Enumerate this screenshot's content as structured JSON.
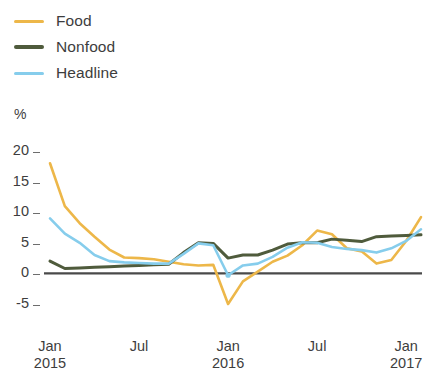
{
  "chart_data": {
    "type": "line",
    "title": "",
    "subtitle": "",
    "xlabel": "",
    "ylabel": "%",
    "ylim": [
      -7.5,
      21
    ],
    "xlim": [
      0,
      25
    ],
    "grid": false,
    "legend_position": "top-left",
    "y_ticks": [
      20,
      15,
      10,
      5,
      0,
      -5
    ],
    "y_tick_labels": [
      "20",
      "15",
      "10",
      "5",
      "0",
      "-5"
    ],
    "x_tick_positions": [
      0,
      6,
      12,
      18,
      24
    ],
    "x_tick_labels": [
      "Jan",
      "Jul",
      "Jan",
      "Jul",
      "Jan"
    ],
    "x_tick_sublabels": [
      "2015",
      "",
      "2016",
      "",
      "2017"
    ],
    "x": [
      0,
      1,
      2,
      3,
      4,
      5,
      6,
      7,
      8,
      9,
      10,
      11,
      12,
      13,
      14,
      15,
      16,
      17,
      18,
      19,
      20,
      21,
      22,
      23,
      24,
      25
    ],
    "x_labels": [
      "Jan 2015",
      "Feb 2015",
      "Mar 2015",
      "Apr 2015",
      "May 2015",
      "Jun 2015",
      "Jul 2015",
      "Aug 2015",
      "Sep 2015",
      "Oct 2015",
      "Nov 2015",
      "Dec 2015",
      "Jan 2016",
      "Feb 2016",
      "Mar 2016",
      "Apr 2016",
      "May 2016",
      "Jun 2016",
      "Jul 2016",
      "Aug 2016",
      "Sep 2016",
      "Oct 2016",
      "Nov 2016",
      "Dec 2016",
      "Jan 2017",
      "Feb 2017"
    ],
    "zero_line": 0,
    "series": [
      {
        "name": "Food",
        "color": "#eeb councils",
        "values": [
          18.0,
          11.0,
          8.2,
          6.0,
          3.9,
          2.6,
          2.5,
          2.3,
          1.9,
          1.5,
          1.3,
          1.4,
          -5.0,
          -1.3,
          0.3,
          1.9,
          2.9,
          4.6,
          7.0,
          6.4,
          4.1,
          3.6,
          1.6,
          2.2,
          5.3,
          9.2
        ]
      },
      {
        "name": "Nonfood",
        "values": [
          2.0,
          0.8,
          0.9,
          1.0,
          1.1,
          1.2,
          1.3,
          1.4,
          1.5,
          3.4,
          5.0,
          4.9,
          2.5,
          3.0,
          3.0,
          3.8,
          4.8,
          5.0,
          5.0,
          5.6,
          5.4,
          5.2,
          6.0,
          6.1,
          6.2,
          6.3
        ]
      },
      {
        "name": "Headline",
        "values": [
          9.0,
          6.5,
          5.0,
          3.0,
          2.0,
          1.8,
          1.7,
          1.6,
          1.6,
          3.2,
          4.9,
          4.6,
          -0.3,
          1.3,
          1.6,
          2.7,
          4.2,
          5.1,
          5.0,
          4.3,
          4.0,
          3.8,
          3.4,
          4.1,
          5.3,
          7.2
        ]
      }
    ],
    "markers": [
      {
        "series": "Headline",
        "x": 12,
        "y": -0.3
      }
    ]
  },
  "legend": {
    "items": [
      {
        "label": "Food",
        "color": "#edb749",
        "weight": "thin"
      },
      {
        "label": "Nonfood",
        "color": "#4f5b3c",
        "weight": "thick"
      },
      {
        "label": "Headline",
        "color": "#86cdec",
        "weight": "thin"
      }
    ]
  },
  "axis": {
    "unit": "%",
    "zero_line_color": "#4a4a4a",
    "tick_color": "#6d6d6d"
  }
}
